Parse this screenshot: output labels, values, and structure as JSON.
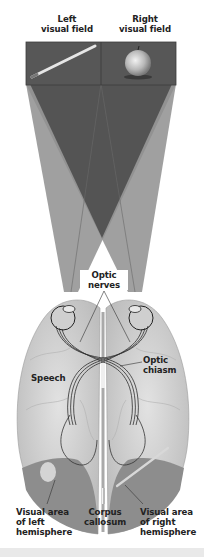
{
  "figure": {
    "top_labels": {
      "left": [
        "Left",
        "visual field"
      ],
      "right": [
        "Right",
        "visual field"
      ]
    },
    "visual_field_panel": {
      "left_object": "pencil",
      "right_object": "apple",
      "panel_color": "#555555"
    },
    "labels": {
      "optic_nerves": [
        "Optic",
        "nerves"
      ],
      "optic_chiasm": [
        "Optic",
        "chiasm"
      ],
      "speech": "Speech",
      "visual_area_left": [
        "Visual area",
        "of left",
        "hemisphere"
      ],
      "corpus_callosum": [
        "Corpus",
        "callosum"
      ],
      "visual_area_right": [
        "Visual area",
        "of right",
        "hemisphere"
      ]
    },
    "colors": {
      "beam_light": "#9a9a9a",
      "beam_dark": "#5c5c5c",
      "brain": "#d2d2d2",
      "visual_area": "#8e8e8e",
      "nerve": "#333333",
      "label": "#222222"
    }
  }
}
